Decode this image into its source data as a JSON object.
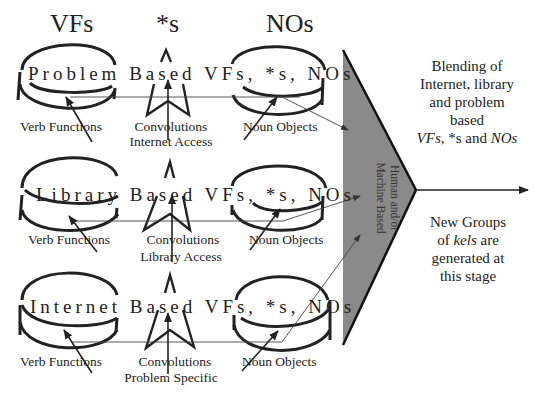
{
  "headers": {
    "verb_functions": "VFs",
    "convolutions": "*s",
    "noun_objects": "NOs"
  },
  "rows": [
    {
      "title": "Problem Based VFs, *s, NOs",
      "left_label": "Verb Functions",
      "center_label": "Convolutions",
      "center_sublabel": "Internet Access",
      "right_label": "Noun Objects"
    },
    {
      "title": "Library Based VFs, *s, NOs",
      "left_label": "Verb Functions",
      "center_label": "Convolutions",
      "center_sublabel": "Library Access",
      "right_label": "Noun Objects"
    },
    {
      "title": "Internet Based VFs, *s, NOs",
      "left_label": "Verb Functions",
      "center_label": "Convolutions",
      "center_sublabel": "Problem Specific",
      "right_label": "Noun Objects"
    }
  ],
  "funnel": {
    "label_line1": "Human and/or",
    "label_line2": "Machine Based",
    "fill_color": "#8a8a8a"
  },
  "right_text_top": {
    "line1": "Blending of",
    "line2": "Internet, library",
    "line3": "and problem",
    "line4": "based",
    "line5_italic_a": "VFs",
    "line5_plain": ", *s and ",
    "line5_italic_b": "NOs"
  },
  "right_text_bottom": {
    "line1": "New Groups",
    "line2_plain_a": "of ",
    "line2_italic": "kels",
    "line2_plain_b": " are",
    "line3": "generated at",
    "line4": "this stage"
  }
}
